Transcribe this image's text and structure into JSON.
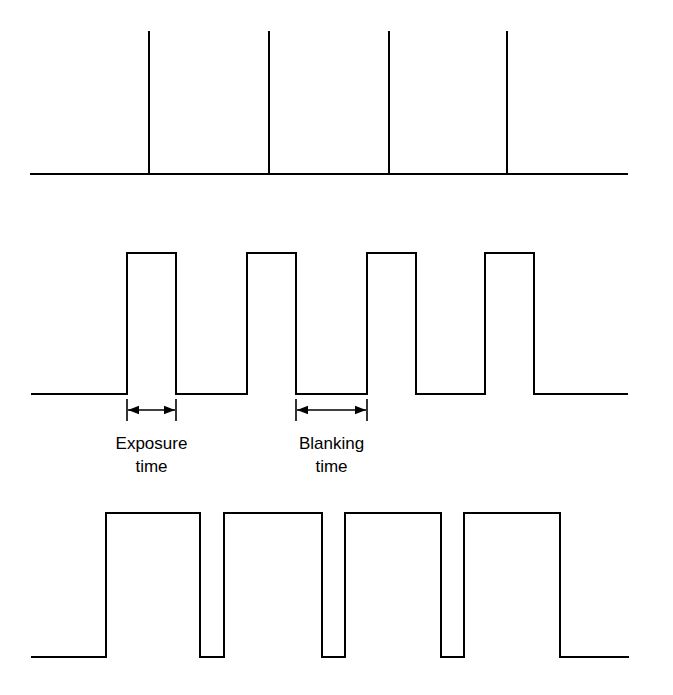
{
  "figure": {
    "background_color": "#ffffff",
    "line_color": "#000000",
    "width": 673,
    "height": 695
  },
  "annotations": {
    "exposure": {
      "line1": "Exposure",
      "line2": "time",
      "span_start_x": 127,
      "span_end_x": 176
    },
    "blanking": {
      "line1": "Blanking",
      "line2": "time",
      "span_start_x": 296,
      "span_end_x": 367
    }
  },
  "chart_data": {
    "type": "line",
    "xlabel": "",
    "ylabel": "",
    "grid": false,
    "legend": "none",
    "xlim": [
      0,
      673
    ],
    "series": [
      {
        "name": "trigger-pulses",
        "description": "Narrow trigger spikes on a flat baseline",
        "waveform": "impulse",
        "baseline_y": 174,
        "peak_y": 31,
        "line_start_x": 31,
        "line_end_x": 627,
        "spike_x": [
          149,
          269,
          389,
          507
        ]
      },
      {
        "name": "exposure-signal",
        "description": "Square wave with short high exposure pulses and longer low blanking intervals",
        "waveform": "square",
        "low_y": 394,
        "high_y": 253,
        "line_start_x": 32,
        "line_end_x": 627,
        "pulses": [
          {
            "rise_x": 127,
            "fall_x": 176
          },
          {
            "rise_x": 247,
            "fall_x": 296
          },
          {
            "rise_x": 367,
            "fall_x": 416
          },
          {
            "rise_x": 485,
            "fall_x": 534
          }
        ]
      },
      {
        "name": "long-exposure-signal",
        "description": "Square wave with long high exposure pulses and short low blanking intervals",
        "waveform": "square",
        "low_y": 657,
        "high_y": 513,
        "line_start_x": 32,
        "line_end_x": 628,
        "pulses": [
          {
            "rise_x": 106,
            "fall_x": 200
          },
          {
            "rise_x": 224,
            "fall_x": 322
          },
          {
            "rise_x": 345,
            "fall_x": 441
          },
          {
            "rise_x": 464,
            "fall_x": 560
          }
        ]
      }
    ]
  }
}
